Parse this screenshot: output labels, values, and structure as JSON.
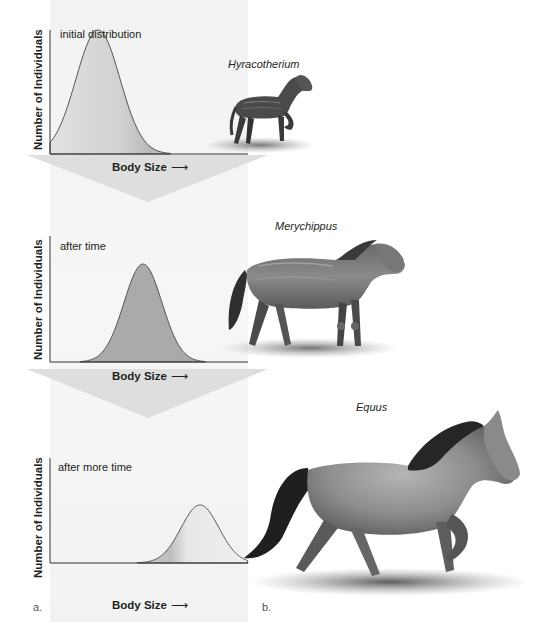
{
  "figure": {
    "panel_a_label": "a.",
    "panel_b_label": "b."
  },
  "charts": [
    {
      "caption": "initial distribution",
      "ylabel": "Number of Individuals",
      "xlabel": "Body Size",
      "xarrow": "⟶",
      "curve": {
        "mean_px": 98,
        "sigma_px": 22,
        "peak_y_px": 30
      }
    },
    {
      "caption": "after time",
      "ylabel": "Number of Individuals",
      "xlabel": "Body Size",
      "xarrow": "⟶",
      "curve": {
        "mean_px": 143,
        "sigma_px": 19,
        "peak_y_px": 50
      }
    },
    {
      "caption": "after more time",
      "ylabel": "Number of Individuals",
      "xlabel": "Body Size",
      "xarrow": "⟶",
      "curve": {
        "mean_px": 200,
        "sigma_px": 19,
        "peak_y_px": 65
      }
    }
  ],
  "species": [
    {
      "name": "Hyracotherium",
      "icon": "small-horse-illustration"
    },
    {
      "name": "Merychippus",
      "icon": "medium-horse-illustration"
    },
    {
      "name": "Equus",
      "icon": "large-horse-illustration"
    }
  ],
  "colors": {
    "curve_fill_1": "#d4d4d4",
    "curve_fill_2": "#a9a9a9",
    "curve_fill_3": "#e3e3e3",
    "funnel_arrow": "#dcdcdc",
    "axis": "#333333"
  }
}
